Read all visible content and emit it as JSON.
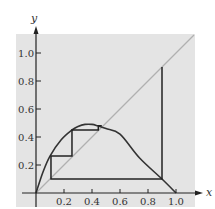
{
  "chart_data": {
    "type": "line",
    "title": "",
    "xlabel": "x",
    "ylabel": "y",
    "xlim": [
      0,
      1.15
    ],
    "ylim": [
      0,
      1.13
    ],
    "grid": false,
    "legend": null,
    "x_ticks": [
      "0.2",
      "0.4",
      "0.6",
      "0.8",
      "1.0"
    ],
    "y_ticks": [
      "0.2",
      "0.4",
      "0.6",
      "0.8",
      "1.0"
    ],
    "series": [
      {
        "name": "f(x) curve",
        "style": "solid dark",
        "x": [
          0,
          0.05,
          0.1,
          0.18,
          0.257,
          0.3,
          0.35,
          0.4,
          0.44,
          0.5,
          0.6,
          0.74,
          0.9,
          1.0
        ],
        "y": [
          0,
          0.15,
          0.264,
          0.38,
          0.45,
          0.475,
          0.49,
          0.49,
          0.48,
          0.46,
          0.42,
          0.25,
          0.1,
          0
        ]
      },
      {
        "name": "y = x diagonal",
        "style": "light gray",
        "x": [
          0,
          1.13
        ],
        "y": [
          0,
          1.13
        ]
      },
      {
        "name": "cobweb iteration",
        "style": "solid dark",
        "x": [
          0.9,
          0.9,
          0.107,
          0.107,
          0.257,
          0.257,
          0.445,
          0.445,
          0.47
        ],
        "y": [
          0.9,
          0.1,
          0.1,
          0.264,
          0.264,
          0.45,
          0.45,
          0.48,
          0.48
        ]
      }
    ]
  },
  "axes": {
    "x_label": "x",
    "y_label": "y",
    "x_tick_labels": [
      "0.2",
      "0.4",
      "0.6",
      "0.8",
      "1.0"
    ],
    "y_tick_labels": [
      "0.2",
      "0.4",
      "0.6",
      "0.8",
      "1.0"
    ]
  },
  "colors": {
    "background_panel": "#e4e4e4",
    "curve": "#333333",
    "diagonal": "#b0b0b0",
    "axis": "#222222"
  }
}
